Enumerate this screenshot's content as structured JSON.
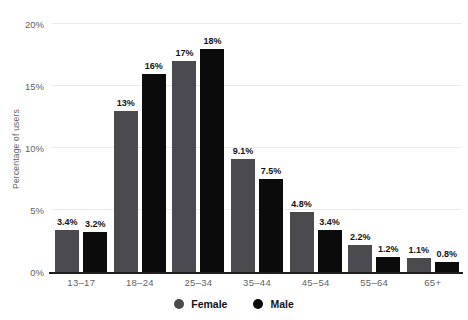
{
  "chart_data": {
    "type": "bar",
    "title": "",
    "ylabel": "Percentage of users",
    "categories": [
      "13–17",
      "18–24",
      "25–34",
      "35–44",
      "45–54",
      "55–64",
      "65+"
    ],
    "series": [
      {
        "name": "Female",
        "color": "#4a4a4f",
        "values": [
          3.4,
          13,
          17,
          9.1,
          4.8,
          2.2,
          1.1
        ],
        "labels": [
          "3.4%",
          "13%",
          "17%",
          "9.1%",
          "4.8%",
          "2.2%",
          "1.1%"
        ]
      },
      {
        "name": "Male",
        "color": "#0b0b0b",
        "values": [
          3.2,
          16,
          18,
          7.5,
          3.4,
          1.2,
          0.8
        ],
        "labels": [
          "3.2%",
          "16%",
          "18%",
          "7.5%",
          "3.4%",
          "1.2%",
          "0.8%"
        ]
      }
    ],
    "y_axis": {
      "ticks": [
        {
          "label": "0%",
          "value": 0
        },
        {
          "label": "5%",
          "value": 5
        },
        {
          "label": "10%",
          "value": 10
        },
        {
          "label": "15%",
          "value": 15
        },
        {
          "label": "20%",
          "value": 20
        }
      ],
      "ylim": [
        0,
        20
      ],
      "grid": true
    },
    "legend": {
      "position": "bottom",
      "entries": [
        "Female",
        "Male"
      ]
    },
    "colors": {
      "axis": "#1e1e1e",
      "grid": "#ececec",
      "tick_text": "#636363",
      "value_label_text": "#141414",
      "background": "#ffffff"
    }
  }
}
